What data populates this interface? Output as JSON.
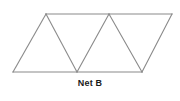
{
  "figure": {
    "caption": "Net B",
    "kind": "geometric-net",
    "colors": {
      "background": "#ffffff",
      "stroke": "#8a8a8a",
      "caption_text": "#1a1a1a"
    },
    "geometry": {
      "top_edge": {
        "x1": 46,
        "y1": 14,
        "x2": 172,
        "y2": 14
      },
      "bottom_edge": {
        "x1": 13,
        "y1": 72,
        "x2": 142,
        "y2": 72
      },
      "top_vertices": [
        {
          "label": "T1",
          "x": 46,
          "y": 14
        },
        {
          "label": "T2",
          "x": 109,
          "y": 14
        },
        {
          "label": "T3",
          "x": 172,
          "y": 14
        }
      ],
      "bottom_vertices": [
        {
          "label": "B1",
          "x": 13,
          "y": 72
        },
        {
          "label": "B2",
          "x": 77,
          "y": 72
        },
        {
          "label": "B3",
          "x": 142,
          "y": 72
        }
      ],
      "edges": [
        {
          "name": "top-edge",
          "from": [
            46,
            14
          ],
          "to": [
            172,
            14
          ]
        },
        {
          "name": "bottom-edge",
          "from": [
            13,
            72
          ],
          "to": [
            142,
            72
          ]
        },
        {
          "name": "left-diagonal",
          "from": [
            13,
            72
          ],
          "to": [
            46,
            14
          ]
        },
        {
          "name": "diagonal-1",
          "from": [
            46,
            14
          ],
          "to": [
            77,
            72
          ]
        },
        {
          "name": "diagonal-2",
          "from": [
            77,
            72
          ],
          "to": [
            109,
            14
          ]
        },
        {
          "name": "diagonal-3",
          "from": [
            109,
            14
          ],
          "to": [
            142,
            72
          ]
        },
        {
          "name": "right-diagonal",
          "from": [
            142,
            72
          ],
          "to": [
            172,
            14
          ]
        }
      ],
      "triangles": [
        {
          "name": "triangle-1-up",
          "points": "13,72 46,14 77,72"
        },
        {
          "name": "triangle-2-down",
          "points": "46,14 109,14 77,72"
        },
        {
          "name": "triangle-3-up",
          "points": "77,72 109,14 142,72"
        },
        {
          "name": "triangle-4-down",
          "points": "109,14 172,14 142,72"
        }
      ]
    }
  }
}
